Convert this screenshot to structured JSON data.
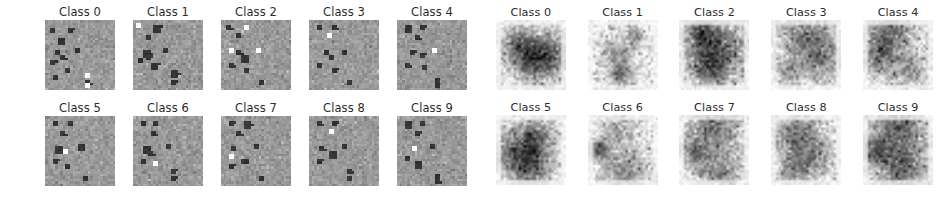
{
  "figure": {
    "background": "#ffffff",
    "width": 947,
    "height": 202,
    "title_color": "#2b2b2b"
  },
  "chart_data": {
    "type": "heatmap",
    "title": "",
    "subtitle": "",
    "xlabel": "",
    "ylabel": "",
    "grid": false,
    "legend": "none",
    "layout": {
      "panels": 2,
      "rows_per_panel": 2,
      "cols_per_panel": 5,
      "tiles_per_panel": 10,
      "tile_pixels": [
        28,
        28
      ]
    },
    "panels": [
      {
        "name": "left-panel",
        "description": "noisy mid-gray saliency tiles with dark and bright square patches",
        "colormap": "gray",
        "base_value": 0.6,
        "noise_sigma": 0.045,
        "value_range": [
          0.0,
          1.0
        ],
        "tiles": [
          {
            "label": "Class 0",
            "dark_patches": [
              [
                3,
                2
              ],
              [
                3,
                9
              ],
              [
                7,
                5
              ],
              [
                11,
                12
              ],
              [
                12,
                4
              ],
              [
                14,
                6
              ],
              [
                16,
                2
              ],
              [
                19,
                8
              ],
              [
                24,
                16
              ],
              [
                22,
                3
              ]
            ],
            "bright_patches": [
              [
                21,
                16
              ],
              [
                25,
                16
              ]
            ],
            "mean_value": 0.59
          },
          {
            "label": "Class 1",
            "dark_patches": [
              [
                2,
                8
              ],
              [
                6,
                5
              ],
              [
                11,
                12
              ],
              [
                12,
                4
              ],
              [
                14,
                5
              ],
              [
                17,
                7
              ],
              [
                15,
                2
              ],
              [
                20,
                15
              ],
              [
                24,
                15
              ]
            ],
            "bright_patches": [
              [
                1,
                1
              ]
            ],
            "mean_value": 0.59
          },
          {
            "label": "Class 2",
            "dark_patches": [
              [
                2,
                2
              ],
              [
                5,
                6
              ],
              [
                12,
                6
              ],
              [
                14,
                8
              ],
              [
                17,
                3
              ],
              [
                19,
                9
              ],
              [
                24,
                15
              ]
            ],
            "bright_patches": [
              [
                11,
                3
              ],
              [
                11,
                14
              ],
              [
                2,
                9
              ]
            ],
            "mean_value": 0.6
          },
          {
            "label": "Class 3",
            "dark_patches": [
              [
                2,
                3
              ],
              [
                2,
                9
              ],
              [
                12,
                6
              ],
              [
                14,
                8
              ],
              [
                12,
                13
              ],
              [
                17,
                3
              ],
              [
                19,
                9
              ],
              [
                24,
                15
              ]
            ],
            "bright_patches": [
              [
                5,
                7
              ]
            ],
            "mean_value": 0.6
          },
          {
            "label": "Class 4",
            "dark_patches": [
              [
                2,
                3
              ],
              [
                2,
                9
              ],
              [
                6,
                7
              ],
              [
                12,
                5
              ],
              [
                13,
                9
              ],
              [
                17,
                3
              ],
              [
                18,
                10
              ],
              [
                23,
                15
              ],
              [
                25,
                15
              ]
            ],
            "bright_patches": [
              [
                11,
                14
              ]
            ],
            "mean_value": 0.6
          },
          {
            "label": "Class 5",
            "dark_patches": [
              [
                2,
                3
              ],
              [
                2,
                9
              ],
              [
                6,
                6
              ],
              [
                11,
                13
              ],
              [
                12,
                4
              ],
              [
                17,
                3
              ],
              [
                19,
                8
              ],
              [
                24,
                15
              ]
            ],
            "bright_patches": [
              [
                13,
                7
              ]
            ],
            "mean_value": 0.59
          },
          {
            "label": "Class 6",
            "dark_patches": [
              [
                2,
                3
              ],
              [
                2,
                8
              ],
              [
                6,
                7
              ],
              [
                11,
                13
              ],
              [
                12,
                4
              ],
              [
                14,
                6
              ],
              [
                17,
                3
              ],
              [
                21,
                15
              ],
              [
                24,
                15
              ]
            ],
            "bright_patches": [
              [
                18,
                8
              ]
            ],
            "mean_value": 0.59
          },
          {
            "label": "Class 7",
            "dark_patches": [
              [
                2,
                3
              ],
              [
                2,
                9
              ],
              [
                6,
                6
              ],
              [
                11,
                13
              ],
              [
                12,
                4
              ],
              [
                17,
                8
              ],
              [
                19,
                3
              ],
              [
                24,
                15
              ]
            ],
            "bright_patches": [
              [
                15,
                3
              ]
            ],
            "mean_value": 0.59
          },
          {
            "label": "Class 8",
            "dark_patches": [
              [
                2,
                3
              ],
              [
                2,
                9
              ],
              [
                12,
                4
              ],
              [
                14,
                8
              ],
              [
                17,
                3
              ],
              [
                11,
                13
              ],
              [
                21,
                15
              ],
              [
                24,
                15
              ]
            ],
            "bright_patches": [
              [
                5,
                8
              ]
            ],
            "mean_value": 0.6
          },
          {
            "label": "Class 9",
            "dark_patches": [
              [
                2,
                3
              ],
              [
                2,
                9
              ],
              [
                6,
                7
              ],
              [
                11,
                13
              ],
              [
                16,
                3
              ],
              [
                18,
                7
              ],
              [
                23,
                15
              ],
              [
                25,
                15
              ]
            ],
            "bright_patches": [
              [
                12,
                6
              ]
            ],
            "mean_value": 0.6
          }
        ]
      },
      {
        "name": "right-panel",
        "description": "light mottled saliency tiles on near-white background, gray speckle texture",
        "colormap": "gray_r",
        "base_value": 0.93,
        "noise_sigma": 0.1,
        "value_range": [
          0.0,
          1.0
        ],
        "tiles": [
          {
            "label": "Class 0",
            "motif": "blob-center-ring",
            "mean_value": 0.88
          },
          {
            "label": "Class 1",
            "motif": "vertical-streaks-right-edge",
            "mean_value": 0.9
          },
          {
            "label": "Class 2",
            "motif": "horizontal-band-upper",
            "mean_value": 0.86
          },
          {
            "label": "Class 3",
            "motif": "top-band-diffuse",
            "mean_value": 0.89
          },
          {
            "label": "Class 4",
            "motif": "top-left-sweep",
            "mean_value": 0.88
          },
          {
            "label": "Class 5",
            "motif": "swirl-left-center",
            "mean_value": 0.87
          },
          {
            "label": "Class 6",
            "motif": "left-edge-vertical-bar",
            "mean_value": 0.9
          },
          {
            "label": "Class 7",
            "motif": "frame-outline",
            "mean_value": 0.88
          },
          {
            "label": "Class 8",
            "motif": "upper-left-cloud",
            "mean_value": 0.9
          },
          {
            "label": "Class 9",
            "motif": "box-outline-dark",
            "mean_value": 0.87
          }
        ]
      }
    ]
  }
}
